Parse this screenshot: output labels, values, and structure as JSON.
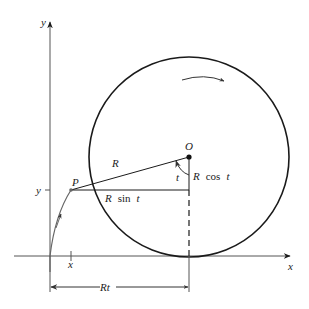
{
  "figure": {
    "type": "cycloid-construction",
    "axes": {
      "x_label": "x",
      "y_label": "y"
    },
    "points": {
      "center_label": "O",
      "point_label": "P"
    },
    "labels": {
      "radius": "R",
      "angle": "t",
      "vertical_leg_R": "R",
      "vertical_leg_cos": "cos",
      "vertical_leg_t": "t",
      "horizontal_leg_R": "R",
      "horizontal_leg_sin": "sin",
      "horizontal_leg_t": "t",
      "x_tick": "x",
      "y_tick": "y",
      "arc_length": "Rt"
    },
    "rotation": "clockwise",
    "colors": {
      "stroke": "#1a1a1a",
      "curve": "#555555",
      "background": "#ffffff"
    }
  }
}
